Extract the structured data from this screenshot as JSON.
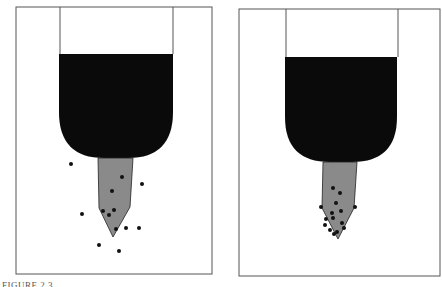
{
  "figure": {
    "caption": "FIGURE 2.3",
    "colors": {
      "frame": "#555555",
      "ink": "#0a0a0a",
      "tip": "#8a8a8a",
      "dots": "#111111",
      "background": "#ffffff"
    },
    "panels": [
      {
        "name": "scattered",
        "frame": {
          "x": 16,
          "y": 7,
          "w": 196,
          "h": 267
        },
        "dots": [
          [
            71,
            164
          ],
          [
            122,
            177
          ],
          [
            142,
            184
          ],
          [
            112,
            191
          ],
          [
            82,
            214
          ],
          [
            103,
            211
          ],
          [
            109,
            215
          ],
          [
            114,
            210
          ],
          [
            116,
            229
          ],
          [
            126,
            228
          ],
          [
            139,
            228
          ],
          [
            99,
            245
          ],
          [
            119,
            251
          ]
        ]
      },
      {
        "name": "clustered",
        "frame": {
          "x": 239,
          "y": 9,
          "w": 201,
          "h": 267
        },
        "dots": [
          [
            333,
            188
          ],
          [
            340,
            193
          ],
          [
            336,
            203
          ],
          [
            341,
            211
          ],
          [
            321,
            207
          ],
          [
            355,
            207
          ],
          [
            332,
            213
          ],
          [
            333,
            218
          ],
          [
            326,
            219
          ],
          [
            325,
            225
          ],
          [
            342,
            223
          ],
          [
            344,
            228
          ],
          [
            330,
            230
          ],
          [
            334,
            234
          ],
          [
            337,
            232
          ]
        ]
      }
    ]
  }
}
